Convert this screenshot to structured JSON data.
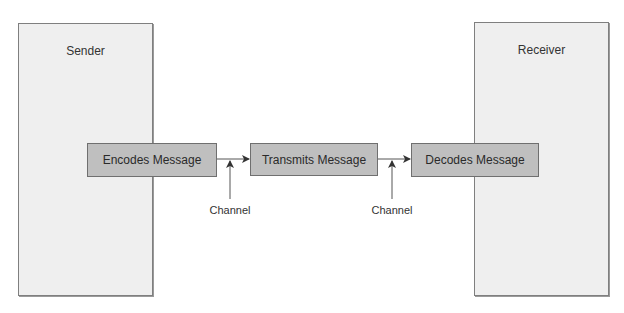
{
  "diagram": {
    "type": "communication-process",
    "panels": {
      "sender": {
        "label": "Sender"
      },
      "receiver": {
        "label": "Receiver"
      }
    },
    "steps": [
      {
        "id": "encode",
        "label": "Encodes Message"
      },
      {
        "id": "transmit",
        "label": "Transmits Message"
      },
      {
        "id": "decode",
        "label": "Decodes Message"
      }
    ],
    "channels": [
      {
        "label": "Channel"
      },
      {
        "label": "Channel"
      }
    ],
    "colors": {
      "panel_fill": "#efefef",
      "step_fill": "#bfbfbf",
      "stroke": "#6f6f6f",
      "arrow": "#333333"
    }
  }
}
